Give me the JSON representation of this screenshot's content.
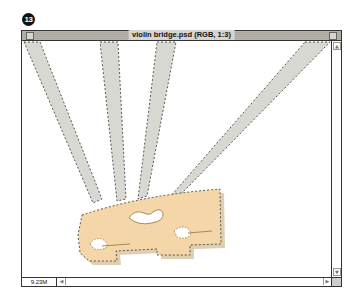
{
  "badge": {
    "number": "13"
  },
  "window": {
    "title": "violin bridge.psd (RGB, 1:3)",
    "status_size": "9.23M",
    "scroll_up_glyph": "▲",
    "scroll_down_glyph": "▼",
    "scroll_left_glyph": "◀",
    "scroll_right_glyph": "▶"
  },
  "canvas": {
    "image": "violin bridge with four strings",
    "selection": "marching ants selection around bridge and strings",
    "colors": {
      "string": "#d8d8d2",
      "bridge": "#f4d6a8",
      "bridge_shadow": "#c9ad7e",
      "selection": "#333333"
    }
  }
}
